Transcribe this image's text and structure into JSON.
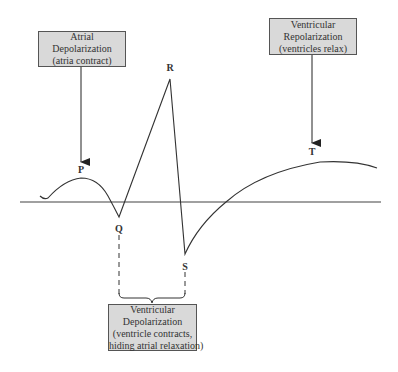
{
  "diagram": {
    "labels": {
      "p": "P",
      "q": "Q",
      "r": "R",
      "s": "S",
      "t": "T"
    },
    "boxes": {
      "atrial_depolarization": {
        "line1": "Atrial",
        "line2": "Depolarization",
        "line3": "(atria contract)"
      },
      "ventricular_repolarization": {
        "line1": "Ventricular",
        "line2": "Repolarization",
        "line3": "(ventricles relax)"
      },
      "ventricular_depolarization": {
        "line1": "Ventricular",
        "line2": "Depolarization",
        "line3": "(ventricle contracts,",
        "line4": "hiding atrial relaxation)"
      }
    },
    "colors": {
      "box_fill": "#d9d9d9",
      "box_border": "#555555",
      "waveform": "#333333",
      "baseline": "#a0a0a0"
    }
  }
}
